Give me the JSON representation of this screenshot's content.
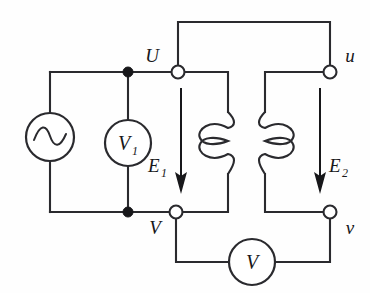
{
  "diagram": {
    "type": "electrical-schematic",
    "background_color": "#fefefe",
    "line_color": "#2a2a2e",
    "labels": {
      "terminal_U": "U",
      "terminal_V": "V",
      "terminal_u": "u",
      "terminal_v": "v",
      "emf_primary": "E",
      "emf_primary_sub": "1",
      "emf_secondary": "E",
      "emf_secondary_sub": "2",
      "voltmeter_primary": "V",
      "voltmeter_primary_sub": "1",
      "voltmeter_secondary": "V"
    },
    "components": [
      {
        "name": "ac-source",
        "label": "",
        "symbol": "sine-wave",
        "cx": 50,
        "cy": 137,
        "r": 24
      },
      {
        "name": "voltmeter-primary",
        "label": "V1",
        "symbol": "circle-meter",
        "cx": 128,
        "cy": 143,
        "r": 23
      },
      {
        "name": "coil-primary",
        "label": "E1",
        "symbol": "inductor-winding",
        "turns": 2
      },
      {
        "name": "coil-secondary",
        "label": "E2",
        "symbol": "inductor-winding",
        "turns": 2
      },
      {
        "name": "voltmeter-secondary",
        "label": "V",
        "symbol": "circle-meter",
        "cx": 252,
        "cy": 262,
        "r": 23
      }
    ],
    "terminals": [
      {
        "name": "U",
        "style": "open",
        "x": 178,
        "y": 72
      },
      {
        "name": "V",
        "style": "open",
        "x": 176,
        "y": 212
      },
      {
        "name": "u",
        "style": "open",
        "x": 330,
        "y": 72
      },
      {
        "name": "v",
        "style": "open",
        "x": 330,
        "y": 212
      },
      {
        "name": "junction-top",
        "style": "filled",
        "x": 128,
        "y": 72
      },
      {
        "name": "junction-bottom",
        "style": "filled",
        "x": 128,
        "y": 212
      }
    ],
    "arrows": [
      {
        "name": "E1",
        "direction": "down",
        "x": 181,
        "y_start": 88,
        "y_end": 192
      },
      {
        "name": "E2",
        "direction": "down",
        "x": 320,
        "y_start": 88,
        "y_end": 192
      }
    ]
  }
}
